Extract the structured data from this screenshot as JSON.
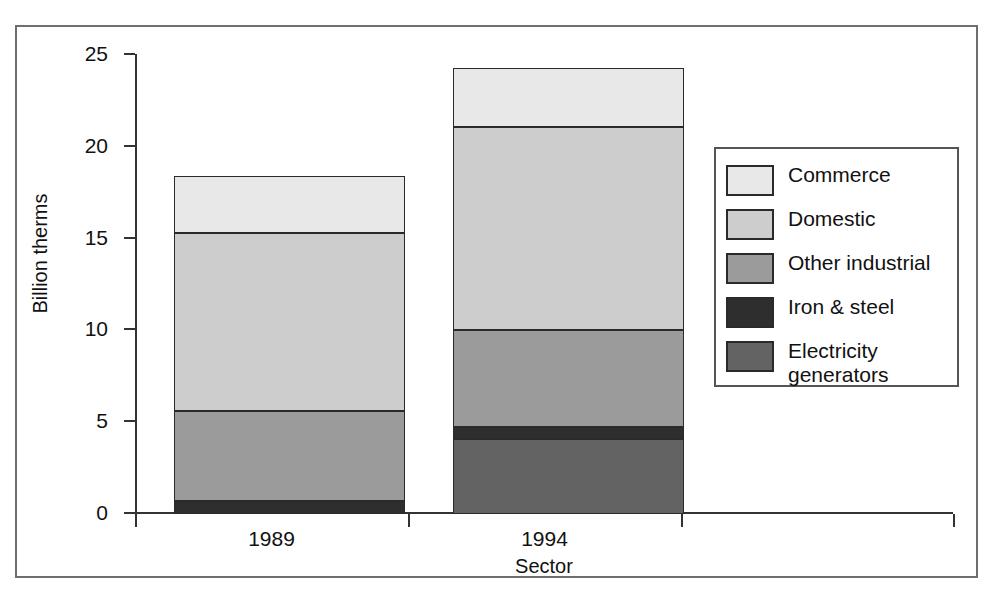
{
  "chart_data": {
    "type": "bar",
    "stacked": true,
    "title": "",
    "xlabel": "Sector",
    "ylabel": "Billion therms",
    "categories": [
      "1989",
      "1994"
    ],
    "ylim": [
      0,
      25
    ],
    "yticks": [
      0,
      5,
      10,
      15,
      20,
      25
    ],
    "ytick_labels": [
      "0",
      "5",
      "10",
      "15",
      "20",
      "25"
    ],
    "grid": false,
    "legend_position": "right",
    "series": [
      {
        "name": "Commerce",
        "color": "#e8e8e8",
        "values": [
          3.1,
          3.2
        ]
      },
      {
        "name": "Domestic",
        "color": "#cdcdcd",
        "values": [
          9.7,
          11.1
        ]
      },
      {
        "name": "Other industrial",
        "color": "#9b9b9b",
        "values": [
          4.9,
          5.25
        ]
      },
      {
        "name": "Iron & steel",
        "color": "#2e2e2e",
        "values": [
          0.7,
          0.65
        ]
      },
      {
        "name": "Electricity\ngenerators",
        "color": "#636363",
        "values": [
          0.0,
          4.1
        ]
      }
    ],
    "totals": [
      18.4,
      24.3
    ]
  },
  "axis": {
    "y_title": "Billion therms",
    "x_title": "Sector",
    "y_labels": [
      "25",
      "20",
      "15",
      "10",
      "5",
      "0"
    ],
    "x_labels": [
      "1989",
      "1994"
    ]
  },
  "legend": {
    "items": [
      {
        "label": "Commerce",
        "color": "#e8e8e8"
      },
      {
        "label": "Domestic",
        "color": "#cdcdcd"
      },
      {
        "label": "Other industrial",
        "color": "#9b9b9b"
      },
      {
        "label": "Iron & steel",
        "color": "#2e2e2e"
      },
      {
        "label": "Electricity\ngenerators",
        "color": "#636363"
      }
    ]
  }
}
